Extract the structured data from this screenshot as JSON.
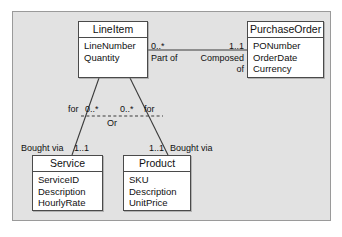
{
  "diagram": {
    "type": "uml-class-diagram",
    "classes": [
      {
        "id": "lineitem",
        "name": "LineItem",
        "attributes": [
          "LineNumber",
          "Quantity"
        ]
      },
      {
        "id": "purchaseorder",
        "name": "PurchaseOrder",
        "attributes": [
          "PONumber",
          "OrderDate",
          "Currency"
        ]
      },
      {
        "id": "service",
        "name": "Service",
        "attributes": [
          "ServiceID",
          "Description",
          "HourlyRate"
        ]
      },
      {
        "id": "product",
        "name": "Product",
        "attributes": [
          "SKU",
          "Description",
          "UnitPrice"
        ]
      }
    ],
    "associations": [
      {
        "id": "lineitem-purchaseorder",
        "source": "lineitem",
        "target": "purchaseorder",
        "source_multiplicity": "0..*",
        "target_multiplicity": "1..1",
        "source_role": "Part of",
        "target_role": "Composed of"
      },
      {
        "id": "lineitem-service",
        "source": "lineitem",
        "target": "service",
        "source_multiplicity": "0..*",
        "target_multiplicity": "1..1",
        "source_role": "for",
        "target_role": "Bought via"
      },
      {
        "id": "lineitem-product",
        "source": "lineitem",
        "target": "product",
        "source_multiplicity": "0..*",
        "target_multiplicity": "1..1",
        "source_role": "for",
        "target_role": "Bought via"
      }
    ],
    "constraint": {
      "id": "xor-constraint",
      "label": "Or"
    },
    "labels": {
      "po_source_mult": "0..*",
      "po_target_mult": "1..1",
      "po_source_role": "Part of",
      "po_target_role_line1": "Composed",
      "po_target_role_line2": "of",
      "service_role": "for",
      "service_branch_mult": "0..*",
      "product_branch_mult": "0..*",
      "product_role": "for",
      "or_label": "Or",
      "service_bought_via": "Bought via",
      "service_mult": "1..1",
      "product_mult": "1..1",
      "product_bought_via": "Bought via"
    },
    "colors": {
      "canvas": "#e2e2e2",
      "frame_border": "#9a9a9a",
      "class_fill": "#ffffff",
      "class_border": "#4a4a4a",
      "line": "#3a3a3a",
      "text": "#111111"
    }
  }
}
